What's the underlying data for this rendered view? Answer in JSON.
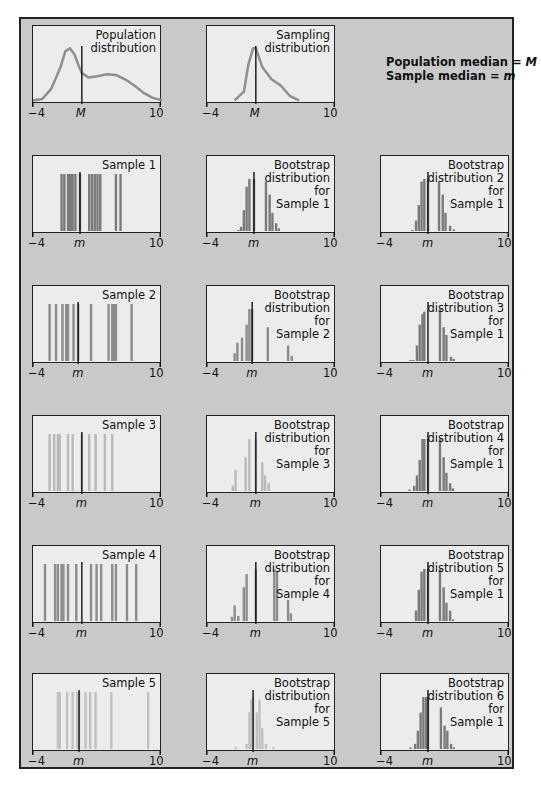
{
  "legend": {
    "line1_label": "Population median = ",
    "line1_symbol": "M",
    "line2_label": "Sample median = ",
    "line2_symbol": "m"
  },
  "axis": {
    "min_label": "−4",
    "max_label": "10",
    "pop_median": "M",
    "sample_median": "m"
  },
  "panels": {
    "population": {
      "title": "Population\ndistribution"
    },
    "sampling": {
      "title": "Sampling\ndistribution"
    },
    "sample1": {
      "title": "Sample 1"
    },
    "sample2": {
      "title": "Sample 2"
    },
    "sample3": {
      "title": "Sample 3"
    },
    "sample4": {
      "title": "Sample 4"
    },
    "sample5": {
      "title": "Sample 5"
    },
    "boot_s1": {
      "title": "Bootstrap\ndistribution\nfor\nSample 1"
    },
    "boot_s2": {
      "title": "Bootstrap\ndistribution\nfor\nSample 2"
    },
    "boot_s3": {
      "title": "Bootstrap\ndistribution\nfor\nSample 3"
    },
    "boot_s4": {
      "title": "Bootstrap\ndistribution\nfor\nSample 4"
    },
    "boot_s5": {
      "title": "Bootstrap\ndistribution\nfor\nSample 5"
    },
    "boot2_s1": {
      "title": "Bootstrap\ndistribution 2\nfor\nSample 1"
    },
    "boot3_s1": {
      "title": "Bootstrap\ndistribution 3\nfor\nSample 1"
    },
    "boot4_s1": {
      "title": "Bootstrap\ndistribution 4\nfor\nSample 1"
    },
    "boot5_s1": {
      "title": "Bootstrap\ndistribution 5\nfor\nSample 1"
    },
    "boot6_s1": {
      "title": "Bootstrap\ndistribution 6\nfor\nSample 1"
    }
  },
  "chart_data": [
    {
      "type": "line",
      "title": "Population distribution",
      "xlim": [
        -4,
        10
      ],
      "median_label": "M",
      "median_x": 1.3,
      "x": [
        -4,
        -3,
        -2,
        -1,
        -0.5,
        0,
        0.5,
        1,
        1.3,
        2,
        3,
        4,
        5,
        6,
        7,
        8,
        9,
        10
      ],
      "y": [
        0.01,
        0.03,
        0.2,
        0.55,
        0.8,
        0.85,
        0.75,
        0.55,
        0.45,
        0.38,
        0.4,
        0.43,
        0.42,
        0.35,
        0.25,
        0.13,
        0.05,
        0.01
      ]
    },
    {
      "type": "line",
      "title": "Sampling distribution",
      "xlim": [
        -4,
        10
      ],
      "median_label": "M",
      "median_x": 1.3,
      "x": [
        -1,
        0,
        0.5,
        1,
        1.3,
        2,
        3,
        4,
        5,
        6
      ],
      "y": [
        0.01,
        0.15,
        0.6,
        0.85,
        0.85,
        0.55,
        0.35,
        0.25,
        0.08,
        0.01
      ]
    },
    {
      "type": "bar",
      "title": "Sample 1",
      "xlim": [
        -4,
        10
      ],
      "median_label": "m",
      "median_x": 1.1,
      "observations": [
        -0.9,
        -0.6,
        -0.2,
        0.0,
        0.2,
        0.3,
        0.6,
        1.1,
        2.1,
        2.4,
        2.7,
        3.0,
        3.3,
        5.0,
        5.5
      ]
    },
    {
      "type": "bar",
      "title": "Sample 2",
      "xlim": [
        -4,
        10
      ],
      "median_label": "m",
      "median_x": 0.9,
      "observations": [
        -2.2,
        -1.5,
        -0.8,
        -0.4,
        -0.2,
        0.4,
        0.9,
        2.3,
        4.2,
        4.6,
        4.8,
        5.0,
        6.7
      ]
    },
    {
      "type": "bar",
      "title": "Sample 3",
      "xlim": [
        -4,
        10
      ],
      "median_label": "m",
      "median_x": 1.3,
      "observations": [
        -2.2,
        -1.7,
        -1.3,
        -1.1,
        -0.2,
        0.3,
        1.3,
        2.1,
        2.8,
        3.8,
        4.6
      ]
    },
    {
      "type": "bar",
      "title": "Sample 4",
      "xlim": [
        -4,
        10
      ],
      "median_label": "m",
      "median_x": 1.3,
      "observations": [
        -2.7,
        -1.6,
        -1.3,
        -0.9,
        -0.7,
        -0.2,
        0.7,
        2.3,
        2.9,
        3.4,
        4.6,
        5.0,
        6.2,
        7.2
      ]
    },
    {
      "type": "bar",
      "title": "Sample 5",
      "xlim": [
        -4,
        10
      ],
      "median_label": "m",
      "median_x": 1.0,
      "observations": [
        -1.3,
        -1.1,
        -0.3,
        0.3,
        0.8,
        1.0,
        1.7,
        2.2,
        2.8,
        4.5,
        8.5
      ]
    },
    {
      "type": "bar",
      "title": "Bootstrap distribution for Sample 1",
      "xlim": [
        -4,
        10
      ],
      "median_label": "m",
      "median_x": 1.1,
      "x": [
        -0.6,
        -0.3,
        0.0,
        0.3,
        0.6,
        1.1,
        2.4,
        2.8,
        3.1,
        3.5,
        3.8
      ],
      "y": [
        0.02,
        0.08,
        0.4,
        0.85,
        1.0,
        1.0,
        0.95,
        0.7,
        0.35,
        0.15,
        0.05
      ]
    },
    {
      "type": "bar",
      "title": "Bootstrap distribution for Sample 2",
      "xlim": [
        -4,
        10
      ],
      "median_label": "m",
      "median_x": 0.9,
      "x": [
        -1.0,
        -0.7,
        -0.2,
        0.3,
        0.6,
        0.9,
        2.6,
        4.8,
        5.2
      ],
      "y": [
        0.15,
        0.35,
        0.45,
        0.7,
        1.0,
        1.0,
        0.65,
        0.3,
        0.1
      ]
    },
    {
      "type": "bar",
      "title": "Bootstrap distribution for Sample 3",
      "xlim": [
        -4,
        10
      ],
      "median_label": "m",
      "median_x": 1.3,
      "x": [
        -1.2,
        -0.9,
        0.2,
        0.6,
        1.3,
        2.0,
        2.3,
        2.7
      ],
      "y": [
        0.1,
        0.4,
        0.65,
        1.0,
        1.0,
        0.55,
        0.3,
        0.15
      ]
    },
    {
      "type": "bar",
      "title": "Bootstrap distribution for Sample 4",
      "xlim": [
        -4,
        10
      ],
      "median_label": "m",
      "median_x": 1.3,
      "x": [
        -1.3,
        -1.0,
        -0.6,
        0.0,
        0.3,
        1.3,
        3.3,
        3.6,
        4.8,
        5.1
      ],
      "y": [
        0.08,
        0.3,
        0.1,
        0.65,
        0.9,
        1.0,
        1.0,
        0.95,
        0.4,
        0.15
      ]
    },
    {
      "type": "bar",
      "title": "Bootstrap distribution for Sample 5",
      "xlim": [
        -4,
        10
      ],
      "median_label": "m",
      "median_x": 1.0,
      "x": [
        -0.9,
        0.3,
        0.6,
        0.8,
        1.0,
        1.4,
        1.7,
        2.0,
        2.4,
        3.2
      ],
      "y": [
        0.04,
        0.1,
        0.7,
        0.95,
        1.0,
        0.7,
        0.95,
        0.4,
        0.1,
        0.04
      ]
    },
    {
      "type": "bar",
      "title": "Bootstrap distribution 2 for Sample 1",
      "xlim": [
        -4,
        10
      ],
      "median_label": "m",
      "median_x": 1.1,
      "x": [
        -0.6,
        -0.2,
        0.1,
        0.4,
        0.7,
        1.1,
        2.3,
        2.7,
        3.0,
        3.5,
        3.9
      ],
      "y": [
        0.02,
        0.2,
        0.5,
        0.95,
        1.0,
        1.0,
        0.95,
        0.7,
        0.35,
        0.1,
        0.03
      ]
    },
    {
      "type": "bar",
      "title": "Bootstrap distribution 3 for Sample 1",
      "xlim": [
        -4,
        10
      ],
      "median_label": "m",
      "median_x": 1.1,
      "x": [
        -0.8,
        -0.5,
        -0.1,
        0.2,
        0.5,
        0.7,
        2.4,
        2.8,
        3.1,
        3.6,
        3.9
      ],
      "y": [
        0.02,
        0.02,
        0.3,
        0.7,
        0.9,
        0.95,
        1.0,
        0.65,
        0.5,
        0.08,
        0.04
      ]
    },
    {
      "type": "bar",
      "title": "Bootstrap distribution 4 for Sample 1",
      "xlim": [
        -4,
        10
      ],
      "median_label": "m",
      "median_x": 1.1,
      "x": [
        -0.9,
        -0.4,
        -0.1,
        0.2,
        0.5,
        0.7,
        1.1,
        2.4,
        2.8,
        3.1,
        3.5,
        3.8
      ],
      "y": [
        0.03,
        0.1,
        0.3,
        0.6,
        1.0,
        1.0,
        1.0,
        1.0,
        0.65,
        0.35,
        0.15,
        0.05
      ]
    },
    {
      "type": "bar",
      "title": "Bootstrap distribution 5 for Sample 1",
      "xlim": [
        -4,
        10
      ],
      "median_label": "m",
      "median_x": 1.1,
      "x": [
        -0.2,
        0.1,
        0.4,
        0.7,
        1.1,
        2.4,
        2.8,
        3.1,
        3.5,
        3.8
      ],
      "y": [
        0.2,
        0.6,
        0.95,
        1.0,
        1.0,
        1.0,
        0.65,
        0.35,
        0.2,
        0.03
      ]
    },
    {
      "type": "bar",
      "title": "Bootstrap distribution 6 for Sample 1",
      "xlim": [
        -4,
        10
      ],
      "median_label": "m",
      "median_x": 1.1,
      "x": [
        -0.8,
        -0.3,
        0.0,
        0.3,
        0.6,
        0.9,
        1.1,
        2.5,
        2.9,
        3.2,
        3.6,
        3.9
      ],
      "y": [
        0.03,
        0.1,
        0.35,
        0.7,
        1.0,
        1.0,
        1.0,
        0.8,
        0.45,
        0.35,
        0.1,
        0.03
      ]
    }
  ]
}
